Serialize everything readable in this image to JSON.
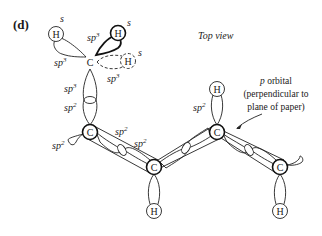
{
  "panel_label": "(d)",
  "view_label": "Top view",
  "annotation": {
    "lines": [
      "p orbital",
      "(perpendicular to",
      "plane of paper)"
    ],
    "p_symbol": "p",
    "line1_rest": " orbital"
  },
  "atoms": {
    "carbon": "C",
    "hydrogen": "H"
  },
  "orbital_labels": {
    "s": "s",
    "sp3": "sp",
    "sp3_sup": "3",
    "sp2": "sp",
    "sp2_sup": "2"
  },
  "molecule": {
    "methyl_group": {
      "hydrogens": [
        {
          "style": "thin",
          "orbital": "s"
        },
        {
          "style": "bold",
          "orbital": "s"
        },
        {
          "style": "dashed",
          "orbital": "s"
        }
      ],
      "bonds_hybridization": [
        "sp3",
        "sp3",
        "sp3",
        "sp3"
      ]
    },
    "chain_carbons": 4,
    "chain_hybridization": "sp2",
    "terminal_hydrogens": 3
  }
}
